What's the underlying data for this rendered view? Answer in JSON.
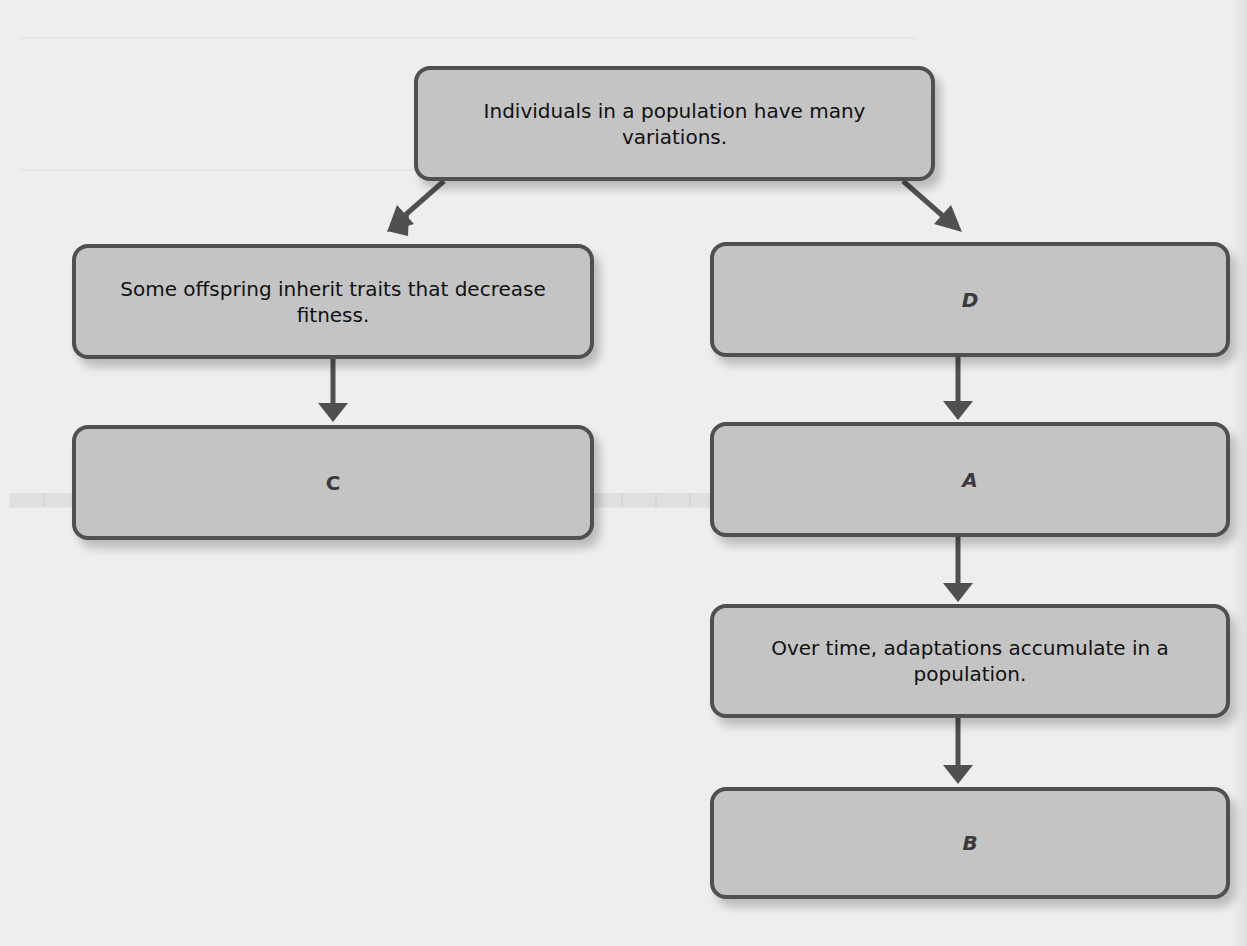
{
  "diagram": {
    "colors": {
      "background": "#eeeeec",
      "node_fill": "#c4c4c4",
      "node_border": "#505050",
      "arrow": "#505050",
      "text": "#111111"
    },
    "nodes": {
      "top": {
        "id": "top",
        "text": "Individuals in a population have many variations."
      },
      "left_1": {
        "id": "left_1",
        "text": "Some offspring inherit traits that decrease fitness."
      },
      "left_2": {
        "id": "left_2",
        "text": "C"
      },
      "right_1": {
        "id": "right_1",
        "text": "D"
      },
      "right_2": {
        "id": "right_2",
        "text": "A"
      },
      "right_3": {
        "id": "right_3",
        "text": "Over time, adaptations accumulate in a population."
      },
      "right_4": {
        "id": "right_4",
        "text": "B"
      }
    },
    "edges": [
      {
        "from": "top",
        "to": "left_1"
      },
      {
        "from": "top",
        "to": "right_1"
      },
      {
        "from": "left_1",
        "to": "left_2"
      },
      {
        "from": "right_1",
        "to": "right_2"
      },
      {
        "from": "right_2",
        "to": "right_3"
      },
      {
        "from": "right_3",
        "to": "right_4"
      }
    ]
  }
}
